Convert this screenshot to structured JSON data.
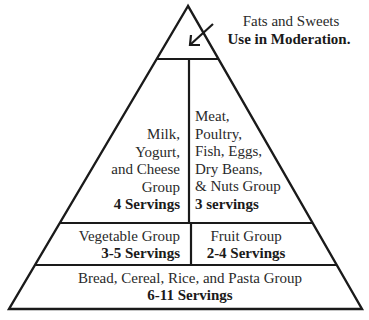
{
  "diagram": {
    "type": "food-pyramid",
    "colors": {
      "line": "#1a1a1a",
      "text": "#2a2a2a",
      "background": "#ffffff"
    },
    "tip": {
      "label": "Fats and Sweets",
      "servings": "Use in Moderation.",
      "pointer": "arrow-down-left"
    },
    "tier2": {
      "left": {
        "lines": [
          "Milk,",
          "Yogurt,",
          "and Cheese",
          "Group"
        ],
        "servings": "4 Servings"
      },
      "right": {
        "lines": [
          "Meat,",
          "Poultry,",
          "Fish, Eggs,",
          "Dry Beans,",
          "& Nuts Group"
        ],
        "servings": "3 servings"
      }
    },
    "tier3": {
      "left": {
        "label": "Vegetable Group",
        "servings": "3-5 Servings"
      },
      "right": {
        "label": "Fruit Group",
        "servings": "2-4 Servings"
      }
    },
    "base": {
      "label": "Bread, Cereal, Rice, and Pasta Group",
      "servings": "6-11 Servings"
    }
  }
}
